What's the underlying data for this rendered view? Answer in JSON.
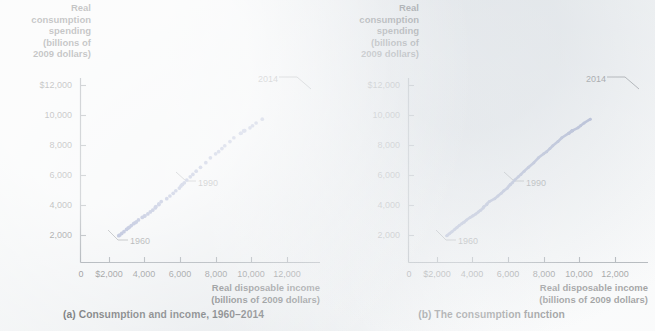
{
  "figure": {
    "background_color": "#f2f4f5",
    "ink_color": "#16181a",
    "series_color": "#3a4f9b",
    "axis_color": "#4a5560"
  },
  "panels": [
    {
      "id": "a",
      "caption": "(a) Consumption and income, 1960–2014",
      "y_axis_title_lines": [
        "Real",
        "consumption",
        "spending",
        "(billions of",
        "2009 dollars)"
      ],
      "x_axis_title_lines": [
        "Real disposable income",
        "(billions of 2009 dollars)"
      ],
      "y_ticks": [
        "$12,000",
        "10,000",
        "8,000",
        "6,000",
        "4,000",
        "2,000"
      ],
      "x_ticks": [
        "0",
        "$2,000",
        "4,000",
        "6,000",
        "8,000",
        "10,000",
        "12,000"
      ],
      "annotations": [
        {
          "label": "2014"
        },
        {
          "label": "1990"
        },
        {
          "label": "1960"
        }
      ]
    },
    {
      "id": "b",
      "caption": "(b) The consumption function",
      "y_axis_title_lines": [
        "Real",
        "consumption",
        "spending",
        "(billions of",
        "2009 dollars)"
      ],
      "x_axis_title_lines": [
        "Real disposable income",
        "(billions of 2009 dollars)"
      ],
      "y_ticks": [
        "$12,000",
        "10,000",
        "8,000",
        "6,000",
        "4,000",
        "2,000"
      ],
      "x_ticks": [
        "0",
        "$2,000",
        "4,000",
        "6,000",
        "8,000",
        "10,000",
        "12,000"
      ],
      "annotations": [
        {
          "label": "2014"
        },
        {
          "label": "1990"
        },
        {
          "label": "1960"
        }
      ]
    }
  ],
  "chart_data": {
    "type": "scatter",
    "title": "Consumption and income, 1960–2014",
    "xlabel": "Real disposable income (billions of 2009 dollars)",
    "ylabel": "Real consumption spending (billions of 2009 dollars)",
    "xlim": [
      0,
      13000
    ],
    "ylim": [
      0,
      13000
    ],
    "xticks": [
      0,
      2000,
      4000,
      6000,
      8000,
      10000,
      12000
    ],
    "yticks": [
      2000,
      4000,
      6000,
      8000,
      10000,
      12000
    ],
    "grid": false,
    "legend": "none",
    "series": [
      {
        "name": "Consumption vs. disposable income, 1960–2014",
        "point_color": "#3a4f9b",
        "x": [
          2217,
          2280,
          2387,
          2519,
          2668,
          2764,
          2825,
          2943,
          3080,
          3162,
          3238,
          3361,
          3578,
          3704,
          3737,
          3904,
          4046,
          4185,
          4327,
          4371,
          4351,
          4543,
          4542,
          4681,
          5000,
          5183,
          5375,
          5525,
          5731,
          5822,
          5914,
          5896,
          6020,
          6161,
          6363,
          6516,
          6706,
          6957,
          7266,
          7531,
          7835,
          8008,
          8199,
          8363,
          8664,
          8889,
          9277,
          9482,
          9522,
          9311,
          9460,
          9826,
          9973,
          10179,
          10538
        ],
        "y": [
          1985,
          2033,
          2141,
          2258,
          2402,
          2493,
          2551,
          2661,
          2785,
          2851,
          2908,
          3036,
          3208,
          3294,
          3310,
          3436,
          3572,
          3689,
          3837,
          3920,
          3896,
          4064,
          4108,
          4260,
          4455,
          4632,
          4812,
          4984,
          5160,
          5298,
          5400,
          5401,
          5518,
          5700,
          5911,
          6073,
          6290,
          6545,
          6855,
          7177,
          7448,
          7589,
          7793,
          7984,
          8260,
          8518,
          8813,
          9000,
          8987,
          8816,
          8970,
          9178,
          9316,
          9500,
          9756
        ],
        "years": [
          1960,
          1961,
          1962,
          1963,
          1964,
          1965,
          1966,
          1967,
          1968,
          1969,
          1970,
          1971,
          1972,
          1973,
          1974,
          1975,
          1976,
          1977,
          1978,
          1979,
          1980,
          1981,
          1982,
          1983,
          1984,
          1985,
          1986,
          1987,
          1988,
          1989,
          1990,
          1991,
          1992,
          1993,
          1994,
          1995,
          1996,
          1997,
          1998,
          1999,
          2000,
          2001,
          2002,
          2003,
          2004,
          2005,
          2006,
          2007,
          2008,
          2009,
          2010,
          2011,
          2012,
          2013,
          2014
        ]
      }
    ],
    "annotations": [
      {
        "label": "1960",
        "x": 2217,
        "y": 1985
      },
      {
        "label": "1990",
        "x": 5914,
        "y": 5400
      },
      {
        "label": "2014",
        "x": 10538,
        "y": 9756
      }
    ],
    "panel_b_note": "Same data points connected by the consumption-function line"
  }
}
